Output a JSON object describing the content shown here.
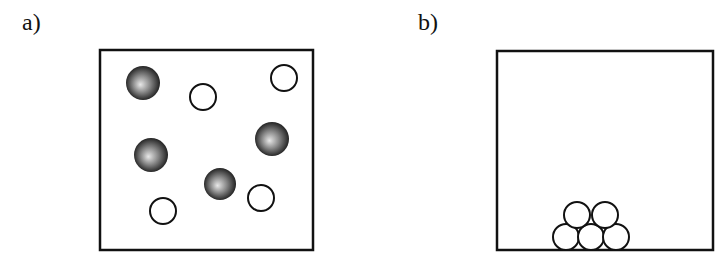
{
  "panels": [
    {
      "label": "a)",
      "description": "Particles dispersed throughout container",
      "box": {
        "x": 100,
        "y": 50,
        "width": 213,
        "height": 200
      },
      "dark_spheres": [
        {
          "cx": 143,
          "cy": 83,
          "r": 17
        },
        {
          "cx": 151,
          "cy": 155,
          "r": 17
        },
        {
          "cx": 272,
          "cy": 139,
          "r": 17
        },
        {
          "cx": 220,
          "cy": 184,
          "r": 16
        }
      ],
      "open_circles": [
        {
          "cx": 203,
          "cy": 97,
          "r": 13
        },
        {
          "cx": 284,
          "cy": 78,
          "r": 13
        },
        {
          "cx": 163,
          "cy": 211,
          "r": 13
        },
        {
          "cx": 261,
          "cy": 198,
          "r": 13
        }
      ]
    },
    {
      "label": "b)",
      "description": "Particles stacked at bottom of container",
      "box": {
        "x": 497,
        "y": 51,
        "width": 216,
        "height": 199
      },
      "dark_spheres": [],
      "open_circles": [
        {
          "cx": 566,
          "cy": 237,
          "r": 13
        },
        {
          "cx": 591,
          "cy": 237,
          "r": 13
        },
        {
          "cx": 616,
          "cy": 237,
          "r": 13
        },
        {
          "cx": 577,
          "cy": 215,
          "r": 13
        },
        {
          "cx": 605,
          "cy": 215,
          "r": 13
        }
      ]
    }
  ],
  "colors": {
    "stroke": "#111111",
    "background": "#ffffff",
    "sphere_dark": "#1a1a1a",
    "sphere_light": "#e8e8e8"
  }
}
